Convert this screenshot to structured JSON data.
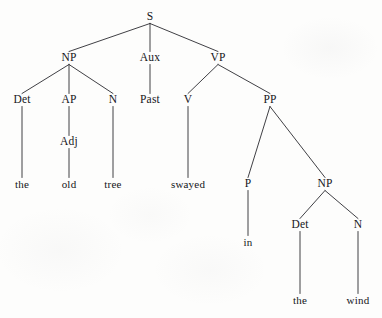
{
  "figure": {
    "kind": "phrase-structure-syntax-tree",
    "sentence": "the old tree swayed in the wind",
    "background_color": "#fdfdfc",
    "ink_color": "#15151a",
    "line_color": "#2a2a30"
  },
  "nodes": [
    {
      "id": "S",
      "label": "S",
      "x": 150,
      "y": 17,
      "type": "category"
    },
    {
      "id": "NP1",
      "label": "NP",
      "x": 69,
      "y": 58,
      "type": "category"
    },
    {
      "id": "Aux",
      "label": "Aux",
      "x": 150,
      "y": 58,
      "type": "category"
    },
    {
      "id": "VP",
      "label": "VP",
      "x": 218,
      "y": 58,
      "type": "category"
    },
    {
      "id": "Det1",
      "label": "Det",
      "x": 22,
      "y": 100,
      "type": "category"
    },
    {
      "id": "AP",
      "label": "AP",
      "x": 69,
      "y": 100,
      "type": "category"
    },
    {
      "id": "N1",
      "label": "N",
      "x": 113,
      "y": 100,
      "type": "category"
    },
    {
      "id": "Past",
      "label": "Past",
      "x": 150,
      "y": 100,
      "type": "category"
    },
    {
      "id": "V",
      "label": "V",
      "x": 188,
      "y": 100,
      "type": "category"
    },
    {
      "id": "PP",
      "label": "PP",
      "x": 270,
      "y": 100,
      "type": "category"
    },
    {
      "id": "Adj",
      "label": "Adj",
      "x": 69,
      "y": 142,
      "type": "category"
    },
    {
      "id": "the1",
      "label": "the",
      "x": 22,
      "y": 184,
      "type": "terminal"
    },
    {
      "id": "old",
      "label": "old",
      "x": 69,
      "y": 184,
      "type": "terminal"
    },
    {
      "id": "tree",
      "label": "tree",
      "x": 113,
      "y": 184,
      "type": "terminal"
    },
    {
      "id": "swayed",
      "label": "swayed",
      "x": 188,
      "y": 184,
      "type": "terminal"
    },
    {
      "id": "P",
      "label": "P",
      "x": 248,
      "y": 184,
      "type": "category"
    },
    {
      "id": "NP2",
      "label": "NP",
      "x": 325,
      "y": 184,
      "type": "category"
    },
    {
      "id": "in",
      "label": "in",
      "x": 248,
      "y": 242,
      "type": "terminal"
    },
    {
      "id": "Det2",
      "label": "Det",
      "x": 300,
      "y": 225,
      "type": "category"
    },
    {
      "id": "N2",
      "label": "N",
      "x": 358,
      "y": 225,
      "type": "category"
    },
    {
      "id": "the2",
      "label": "the",
      "x": 300,
      "y": 300,
      "type": "terminal"
    },
    {
      "id": "wind",
      "label": "wind",
      "x": 358,
      "y": 300,
      "type": "terminal"
    }
  ],
  "edges": [
    {
      "from": "S",
      "to": "NP1"
    },
    {
      "from": "S",
      "to": "Aux"
    },
    {
      "from": "S",
      "to": "VP"
    },
    {
      "from": "NP1",
      "to": "Det1"
    },
    {
      "from": "NP1",
      "to": "AP"
    },
    {
      "from": "NP1",
      "to": "N1"
    },
    {
      "from": "Aux",
      "to": "Past"
    },
    {
      "from": "VP",
      "to": "V"
    },
    {
      "from": "VP",
      "to": "PP"
    },
    {
      "from": "AP",
      "to": "Adj"
    },
    {
      "from": "Det1",
      "to": "the1"
    },
    {
      "from": "Adj",
      "to": "old"
    },
    {
      "from": "N1",
      "to": "tree"
    },
    {
      "from": "V",
      "to": "swayed"
    },
    {
      "from": "PP",
      "to": "P"
    },
    {
      "from": "PP",
      "to": "NP2"
    },
    {
      "from": "P",
      "to": "in"
    },
    {
      "from": "NP2",
      "to": "Det2"
    },
    {
      "from": "NP2",
      "to": "N2"
    },
    {
      "from": "Det2",
      "to": "the2"
    },
    {
      "from": "N2",
      "to": "wind"
    }
  ]
}
